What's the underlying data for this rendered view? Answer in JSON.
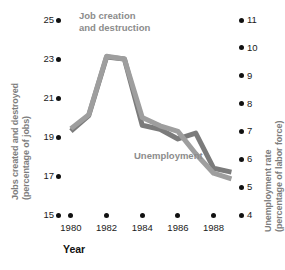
{
  "chart_data": {
    "type": "line",
    "title": "",
    "xlabel": "Year",
    "x": [
      1980,
      1981,
      1982,
      1983,
      1984,
      1985,
      1986,
      1987,
      1988,
      1989
    ],
    "axes": {
      "left": {
        "label": "Jobs created and destroyed",
        "sublabel": "(percentage of jobs)",
        "ticks": [
          15,
          17,
          19,
          21,
          23,
          25
        ],
        "ylim": [
          15,
          25
        ]
      },
      "right": {
        "label": "Unemployment rate",
        "sublabel": "(percentage of labor force)",
        "ticks": [
          4,
          5,
          6,
          7,
          8,
          9,
          10,
          11
        ],
        "ylim": [
          4,
          11
        ]
      },
      "x": {
        "ticks": [
          1980,
          1982,
          1984,
          1986,
          1988
        ],
        "xlim": [
          1979.5,
          1989.2
        ],
        "grid": false
      }
    },
    "legend_position": "inline-annotations",
    "series": [
      {
        "name": "Job creation and destruction",
        "axis": "left",
        "color": "#7b7b7b",
        "values": [
          19.3,
          20.1,
          23.1,
          23.0,
          19.6,
          19.4,
          18.9,
          19.2,
          17.4,
          17.2
        ]
      },
      {
        "name": "Unemployment",
        "axis": "right",
        "color": "#9e9e9e",
        "values": [
          7.1,
          7.6,
          9.7,
          9.6,
          7.5,
          7.2,
          7.0,
          6.2,
          5.5,
          5.3
        ]
      }
    ],
    "annotations": [
      {
        "name": "job-creation-label",
        "text_line1": "Job creation",
        "text_line2": "and destruction"
      },
      {
        "name": "unemployment-label",
        "text_line1": "Unemployment"
      }
    ]
  },
  "left_axis": {
    "title_line1": "Jobs created and destroyed",
    "title_line2": "(percentage of jobs)",
    "ticks": [
      "25",
      "23",
      "21",
      "19",
      "17",
      "15"
    ]
  },
  "right_axis": {
    "title_line1": "Unemployment rate",
    "title_line2": "(percentage of labor force)",
    "ticks": [
      "11",
      "10",
      "9",
      "8",
      "7",
      "6",
      "5",
      "4"
    ]
  },
  "x_axis": {
    "title": "Year",
    "ticks": [
      "1980",
      "1982",
      "1984",
      "1986",
      "1988"
    ]
  },
  "annotations": {
    "job_line1": "Job creation",
    "job_line2": "and destruction",
    "unemployment": "Unemployment"
  },
  "colors": {
    "series_job": "#7b7b7b",
    "series_unemployment": "#9e9e9e",
    "text": "#1a1a1a",
    "axis_title": "#7d7d7d",
    "background": "#ffffff"
  }
}
